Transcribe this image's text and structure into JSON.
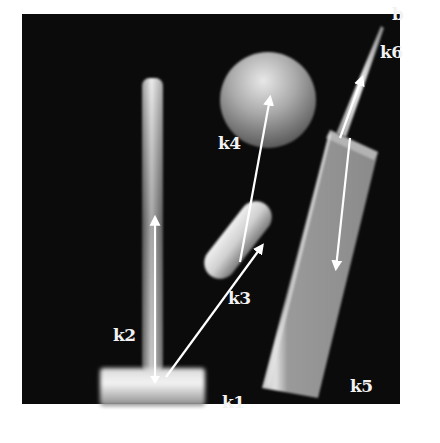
{
  "figure": {
    "background": "#0b0b0b",
    "frame": {
      "x": 22,
      "y": 14,
      "width": 378,
      "height": 390
    },
    "labels": {
      "k1": "k1",
      "k2": "k2",
      "k3": "k3",
      "k4": "k4",
      "k5": "k5",
      "k6": "k6",
      "b": "b"
    },
    "objects": [
      {
        "id": "base-block",
        "label": "k1",
        "shape": "box"
      },
      {
        "id": "tall-cylinder",
        "label": "k2",
        "shape": "cylinder"
      },
      {
        "id": "tilted-cylinder",
        "label": "k3",
        "shape": "cylinder"
      },
      {
        "id": "sphere",
        "label": "k4",
        "shape": "sphere"
      },
      {
        "id": "tilted-box",
        "label": "k5",
        "shape": "box"
      },
      {
        "id": "needle",
        "label": "k6",
        "shape": "cone"
      }
    ],
    "arrows": [
      {
        "name": "k2-arrow",
        "from": [
          155,
          375
        ],
        "to": [
          155,
          220
        ]
      },
      {
        "name": "k1-to-k3-arrow",
        "from": [
          165,
          375
        ],
        "to": [
          262,
          248
        ]
      },
      {
        "name": "k3-to-k4-arrow",
        "from": [
          240,
          262
        ],
        "to": [
          270,
          100
        ]
      },
      {
        "name": "k5-arrow",
        "from": [
          350,
          140
        ],
        "to": [
          335,
          265
        ]
      },
      {
        "name": "k6-arrow",
        "from": [
          340,
          135
        ],
        "to": [
          362,
          80
        ]
      }
    ]
  }
}
